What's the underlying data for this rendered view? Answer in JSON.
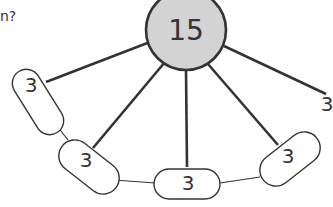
{
  "question_fragment": "n?",
  "diagram": {
    "center": {
      "value": "15",
      "fill": "#d3d3d3"
    },
    "thick_spokes_to": [
      "oval-1",
      "oval-2",
      "oval-3",
      "oval-4",
      "loose-label"
    ],
    "ovals": [
      {
        "id": "oval-1",
        "value": "3"
      },
      {
        "id": "oval-2",
        "value": "3"
      },
      {
        "id": "oval-3",
        "value": "3"
      },
      {
        "id": "oval-4",
        "value": "3"
      }
    ],
    "loose_label": {
      "value": "3"
    },
    "thin_links": [
      [
        "oval-1",
        "oval-2"
      ],
      [
        "oval-2",
        "oval-3"
      ],
      [
        "oval-3",
        "oval-4"
      ]
    ]
  }
}
